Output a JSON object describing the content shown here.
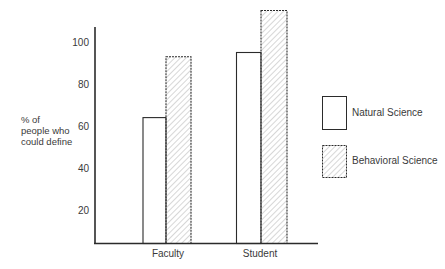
{
  "chart_data": {
    "type": "bar",
    "title": "",
    "xlabel": "",
    "ylabel": [
      "% of",
      "people who",
      "could define"
    ],
    "categories": [
      "Faculty",
      "Student"
    ],
    "series": [
      {
        "name": "Natural Science",
        "pattern": "none",
        "values": [
          64,
          95
        ]
      },
      {
        "name": "Behavioral Science",
        "pattern": "diagonal-hatch",
        "values": [
          93,
          115
        ]
      }
    ],
    "yticks": [
      20,
      40,
      60,
      80,
      100
    ],
    "ylim": [
      0,
      117
    ],
    "grid": false,
    "legend_position": "right",
    "colors": {
      "stroke": "#2b2b2b",
      "hatch": "#b5b5b5",
      "fill": "#ffffff",
      "text": "#3a3a3a"
    }
  }
}
